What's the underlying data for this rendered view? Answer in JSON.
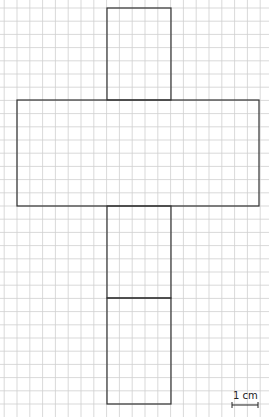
{
  "diagram": {
    "type": "cube-net-on-grid",
    "grid": {
      "origin_x": 4.2,
      "origin_y": 8,
      "step_x": 12.8,
      "step_y": 13.2,
      "color": "#cfcfcf"
    },
    "outline_color": "#333333",
    "shapes": [
      {
        "name": "top-face",
        "x": 107,
        "y": 8,
        "w": 64,
        "h": 92
      },
      {
        "name": "horizontal-arm",
        "x": 17,
        "y": 100,
        "w": 242,
        "h": 106
      },
      {
        "name": "lower-face-1",
        "x": 107,
        "y": 206,
        "w": 64,
        "h": 92
      },
      {
        "name": "bottom-face",
        "x": 107,
        "y": 298,
        "w": 64,
        "h": 106
      }
    ],
    "scale_bar": {
      "label": "1 cm",
      "x1": 232,
      "x2": 258,
      "y": 405
    }
  }
}
